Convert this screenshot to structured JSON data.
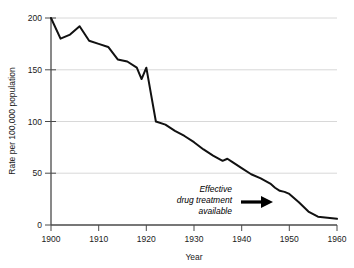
{
  "chart_data": {
    "type": "line",
    "title": "",
    "xlabel": "Year",
    "ylabel": "Rate per 100,000 population",
    "xlim": [
      1900,
      1960
    ],
    "ylim": [
      0,
      200
    ],
    "grid": true,
    "gridlines_y": [
      50,
      100,
      150,
      200
    ],
    "legend": "none",
    "xticks": [
      1900,
      1910,
      1920,
      1930,
      1940,
      1950,
      1960
    ],
    "xtick_labels": [
      "1900",
      "1910",
      "1920",
      "1930",
      "1940",
      "1950",
      "1960"
    ],
    "yticks": [
      0,
      50,
      100,
      150,
      200
    ],
    "ytick_labels": [
      "0",
      "50",
      "100",
      "150",
      "200"
    ],
    "series": [
      {
        "name": "Tuberculosis death rate",
        "color": "#111111",
        "x": [
          1900,
          1902,
          1904,
          1906,
          1908,
          1910,
          1912,
          1914,
          1916,
          1918,
          1919,
          1920,
          1921,
          1922,
          1924,
          1926,
          1928,
          1930,
          1932,
          1934,
          1936,
          1937,
          1938,
          1940,
          1942,
          1944,
          1946,
          1947,
          1948,
          1949,
          1950,
          1952,
          1954,
          1956,
          1958,
          1960
        ],
        "y": [
          200,
          180,
          184,
          192,
          178,
          175,
          172,
          160,
          158,
          152,
          141,
          152,
          126,
          100,
          97,
          91,
          86,
          80,
          73,
          67,
          62,
          64,
          61,
          55,
          49,
          45,
          40,
          36,
          33,
          32,
          30,
          22,
          13,
          8,
          7,
          6
        ]
      }
    ],
    "annotations": [
      {
        "name": "effective-drug-treatment",
        "lines": [
          "Effective",
          "drug treatment",
          "available"
        ],
        "style": "italic",
        "arrow": "right",
        "points_to_year": 1949
      }
    ]
  }
}
